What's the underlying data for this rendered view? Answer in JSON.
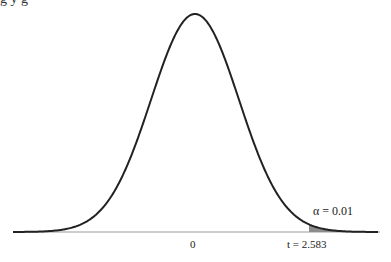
{
  "header": {
    "cropped_text": "g      y g"
  },
  "chart_data": {
    "type": "area",
    "title": "",
    "distribution": "t (bell curve)",
    "xlabel": "",
    "ylabel": "",
    "x_ticks": [
      {
        "label": "0",
        "x": 0
      },
      {
        "label": "t = 2.583",
        "x": 2.583
      }
    ],
    "critical_value": 2.583,
    "shaded_region": "right tail, x > 2.583",
    "annotations": [
      {
        "text": "α = 0.01",
        "target": "right tail"
      }
    ],
    "alpha": 0.01,
    "grid": false,
    "legend": "none"
  },
  "labels": {
    "zero": "0",
    "t_value": "t = 2.583",
    "alpha": "α = 0.01"
  },
  "colors": {
    "curve": "#222222",
    "axis": "#9a9a9a",
    "shade": "#8c8c8c"
  }
}
